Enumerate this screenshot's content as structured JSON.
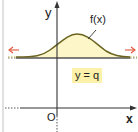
{
  "diagram": {
    "labels": {
      "y_axis": "y",
      "x_axis": "x",
      "origin": "O",
      "curve": "f(x)",
      "asymptote": "y = q"
    },
    "colors": {
      "curve_stroke": "#6b6420",
      "curve_fill": "#fdf6c8",
      "asymptote": "#555555",
      "axis": "#333333",
      "arrows": "#e2553b",
      "label_highlight": "#fbf1a8",
      "border": "#d0d0d0"
    }
  }
}
